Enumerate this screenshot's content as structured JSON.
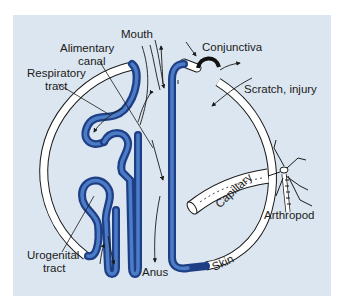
{
  "diagram": {
    "colors": {
      "background": "#dce6f0",
      "tube_blue": "#2f5aa8",
      "tube_blue_dark": "#1e3f85",
      "tube_white": "#ffffff",
      "outline": "#1a1a1a",
      "conjunctiva": "#111111"
    },
    "labels": {
      "mouth": "Mouth",
      "alimentary_line1": "Alimentary",
      "alimentary_line2": "canal",
      "respiratory_line1": "Respiratory",
      "respiratory_line2": "tract",
      "conjunctiva": "Conjunctiva",
      "scratch": "Scratch, injury",
      "capillary": "Capillary",
      "arthropod": "Arthropod",
      "urogenital_line1": "Urogenital",
      "urogenital_line2": "tract",
      "anus": "Anus",
      "skin": "Skin"
    }
  }
}
